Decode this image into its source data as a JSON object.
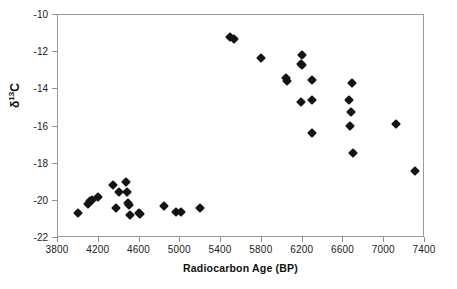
{
  "chart_data": {
    "type": "scatter",
    "title": "",
    "xlabel": "Radiocarbon Age (BP)",
    "ylabel": "δ 13C",
    "ylabel_base": "δ",
    "ylabel_sup": "13",
    "ylabel_tail": "C",
    "xlim": [
      3800,
      7400
    ],
    "ylim": [
      -22,
      -10
    ],
    "xticks": [
      3800,
      4200,
      4600,
      5000,
      5400,
      5800,
      6200,
      6600,
      7000,
      7400
    ],
    "xticklabels": [
      "3800",
      "4200",
      "4600",
      "5000",
      "5400",
      "5800",
      "6200",
      "6600",
      "7000",
      "7400"
    ],
    "yticks": [
      -10,
      -12,
      -14,
      -16,
      -18,
      -20,
      -22
    ],
    "yticklabels": [
      "-10",
      "-12",
      "-14",
      "-16",
      "-18",
      "-20",
      "-22"
    ],
    "grid": false,
    "legend": null,
    "marker": "filled-diamond",
    "marker_color": "#141414",
    "series": [
      {
        "name": "samples",
        "points": [
          [
            4000,
            -20.65
          ],
          [
            4090,
            -20.15
          ],
          [
            4115,
            -20.0
          ],
          [
            4135,
            -19.95
          ],
          [
            4190,
            -19.8
          ],
          [
            4335,
            -19.15
          ],
          [
            4370,
            -20.4
          ],
          [
            4400,
            -19.5
          ],
          [
            4470,
            -19.0
          ],
          [
            4480,
            -19.55
          ],
          [
            4490,
            -20.1
          ],
          [
            4500,
            -20.25
          ],
          [
            4505,
            -20.75
          ],
          [
            4595,
            -20.65
          ],
          [
            4600,
            -20.7
          ],
          [
            4840,
            -20.3
          ],
          [
            4960,
            -20.6
          ],
          [
            5010,
            -20.6
          ],
          [
            5190,
            -20.4
          ],
          [
            5490,
            -11.2
          ],
          [
            5530,
            -11.3
          ],
          [
            5790,
            -12.3
          ],
          [
            6040,
            -13.4
          ],
          [
            6050,
            -13.55
          ],
          [
            6180,
            -12.65
          ],
          [
            6190,
            -12.7
          ],
          [
            6195,
            -12.15
          ],
          [
            6180,
            -14.7
          ],
          [
            6290,
            -13.5
          ],
          [
            6290,
            -14.6
          ],
          [
            6290,
            -16.35
          ],
          [
            6650,
            -14.55
          ],
          [
            6680,
            -13.65
          ],
          [
            6670,
            -15.2
          ],
          [
            6660,
            -15.95
          ],
          [
            6690,
            -17.45
          ],
          [
            7120,
            -15.85
          ],
          [
            7300,
            -18.4
          ]
        ]
      }
    ]
  },
  "axes": {
    "x_axis_name": "radiocarbon-age-axis",
    "y_axis_name": "delta-13c-axis"
  }
}
